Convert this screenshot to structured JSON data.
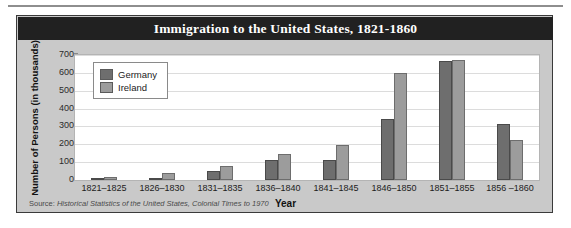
{
  "chart_data": {
    "type": "bar",
    "title": "Immigration to the United States, 1821-1860",
    "xlabel": "Year",
    "ylabel": "Number of Persons (in thousands)",
    "ylim": [
      0,
      700
    ],
    "ytick_values": [
      0,
      100,
      200,
      300,
      400,
      500,
      600,
      700
    ],
    "ytick_labels": [
      "0",
      "100",
      "200",
      "300",
      "400",
      "500",
      "600",
      "700"
    ],
    "grid": true,
    "legend_position": "top-left",
    "categories": [
      "1821–1825",
      "1826–1830",
      "1831–1835",
      "1836–1840",
      "1841–1845",
      "1846–1850",
      "1851–1855",
      "1856 –1860"
    ],
    "series": [
      {
        "name": "Germany",
        "color": "#6e6e6e",
        "values": [
          7,
          8,
          53,
          110,
          112,
          342,
          668,
          315
        ]
      },
      {
        "name": "Ireland",
        "color": "#9c9c9c",
        "values": [
          15,
          40,
          78,
          145,
          198,
          600,
          672,
          225
        ]
      }
    ],
    "source_prefix": "Source:",
    "source_note": "Historical Statistics of the United States, Colonial Times to 1970"
  },
  "panel": {
    "background": "#c9c9c9",
    "border_color": "#3a3a3a",
    "title_band_color": "#212121",
    "title_text_color": "#ffffff",
    "plot_background": "#ffffff",
    "gridline_color": "#dcdcdc"
  }
}
